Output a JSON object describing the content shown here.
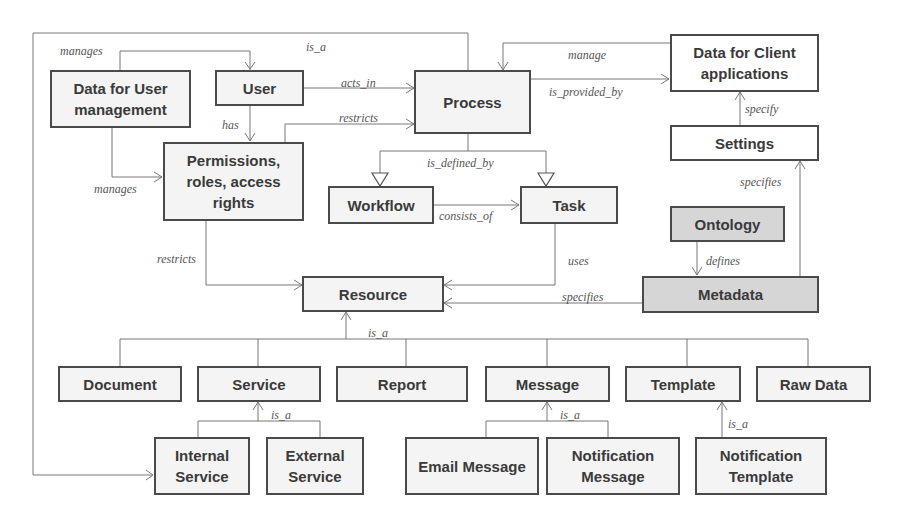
{
  "diagram": {
    "type": "class-relationship-diagram",
    "colors": {
      "node_border": "#4a4a4a",
      "node_fill": "#f4f4f4",
      "node_fill_shaded": "#d6d6d6",
      "edge": "#777777",
      "label_text": "#555555"
    },
    "nodes": {
      "data_user_mgmt": "Data for User management",
      "user": "User",
      "process": "Process",
      "data_client_apps": "Data for Client applications",
      "permissions": "Permissions, roles, access rights",
      "workflow": "Workflow",
      "task": "Task",
      "settings": "Settings",
      "ontology": "Ontology",
      "metadata": "Metadata",
      "resource": "Resource",
      "document": "Document",
      "service": "Service",
      "report": "Report",
      "message": "Message",
      "template": "Template",
      "raw_data": "Raw Data",
      "internal_service": "Internal Service",
      "external_service": "External Service",
      "email_message": "Email Message",
      "notification_message": "Notification Message",
      "notification_template": "Notification Template"
    },
    "edge_labels": {
      "manages_top": "manages",
      "is_a_outer": "is_a",
      "acts_in": "acts_in",
      "restricts_process": "restricts",
      "has": "has",
      "manages_perm": "manages",
      "manage": "manage",
      "is_provided_by": "is_provided_by",
      "specify": "specify",
      "specifies_settings": "specifies",
      "is_defined_by": "is_defined_by",
      "consists_of": "consists_of",
      "restricts_resource": "restricts",
      "uses": "uses",
      "defines": "defines",
      "specifies_resource": "specifies",
      "is_a_resource": "is_a",
      "is_a_service": "is_a",
      "is_a_message": "is_a",
      "is_a_template": "is_a"
    },
    "edges": [
      {
        "from": "Data for User management",
        "to": "User",
        "label": "manages"
      },
      {
        "from": "Data for User management",
        "to": "Permissions, roles, access rights",
        "label": "manages"
      },
      {
        "from": "User",
        "to": "Process",
        "label": "acts_in"
      },
      {
        "from": "User",
        "to": "Permissions, roles, access rights",
        "label": "has"
      },
      {
        "from": "Permissions, roles, access rights",
        "to": "Process",
        "label": "restricts"
      },
      {
        "from": "Permissions, roles, access rights",
        "to": "Resource",
        "label": "restricts"
      },
      {
        "from": "Process",
        "to": "Internal Service",
        "label": "is_a"
      },
      {
        "from": "Data for Client applications",
        "to": "Process",
        "label": "manage"
      },
      {
        "from": "Process",
        "to": "Data for Client applications",
        "label": "is_provided_by"
      },
      {
        "from": "Settings",
        "to": "Data for Client applications",
        "label": "specify"
      },
      {
        "from": "Metadata",
        "to": "Settings",
        "label": "specifies"
      },
      {
        "from": "Process",
        "to": "Workflow",
        "label": "is_defined_by"
      },
      {
        "from": "Process",
        "to": "Task",
        "label": "is_defined_by"
      },
      {
        "from": "Workflow",
        "to": "Task",
        "label": "consists_of"
      },
      {
        "from": "Task",
        "to": "Resource",
        "label": "uses"
      },
      {
        "from": "Ontology",
        "to": "Metadata",
        "label": "defines"
      },
      {
        "from": "Metadata",
        "to": "Resource",
        "label": "specifies"
      },
      {
        "from": "Document",
        "to": "Resource",
        "label": "is_a"
      },
      {
        "from": "Service",
        "to": "Resource",
        "label": "is_a"
      },
      {
        "from": "Report",
        "to": "Resource",
        "label": "is_a"
      },
      {
        "from": "Message",
        "to": "Resource",
        "label": "is_a"
      },
      {
        "from": "Template",
        "to": "Resource",
        "label": "is_a"
      },
      {
        "from": "Raw Data",
        "to": "Resource",
        "label": "is_a"
      },
      {
        "from": "Internal Service",
        "to": "Service",
        "label": "is_a"
      },
      {
        "from": "External Service",
        "to": "Service",
        "label": "is_a"
      },
      {
        "from": "Email Message",
        "to": "Message",
        "label": "is_a"
      },
      {
        "from": "Notification Message",
        "to": "Message",
        "label": "is_a"
      },
      {
        "from": "Notification Template",
        "to": "Template",
        "label": "is_a"
      }
    ]
  }
}
